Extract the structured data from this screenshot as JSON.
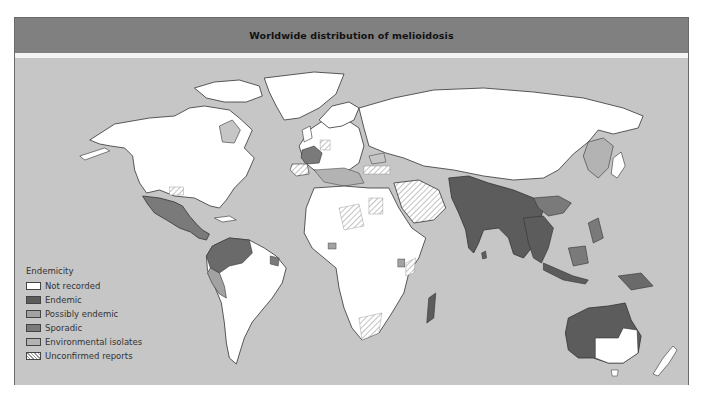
{
  "header": {
    "title": "Worldwide distribution of melioidosis"
  },
  "colors": {
    "ocean": "#c6c6c6",
    "header": "#808080",
    "not_recorded": "#ffffff",
    "endemic": "#5c5c5c",
    "possibly_endemic": "#a2a2a2",
    "sporadic": "#7a7a7a",
    "environmental_isolates": "#b3b3b3",
    "unconfirmed_hatch": "#9a9a9a"
  },
  "legend": {
    "title": "Endemicity",
    "items": [
      {
        "label": "Not recorded",
        "swatch": "not_recorded"
      },
      {
        "label": "Endemic",
        "swatch": "endemic"
      },
      {
        "label": "Possibly endemic",
        "swatch": "possibly_endemic"
      },
      {
        "label": "Sporadic",
        "swatch": "sporadic"
      },
      {
        "label": "Environmental isolates",
        "swatch": "environmental_isolates"
      },
      {
        "label": "Unconfirmed reports",
        "swatch": "unconfirmed_hatch"
      }
    ]
  },
  "regions": {
    "endemic": [
      "Northern Australia",
      "Southeast Asia",
      "South Asia",
      "Madagascar",
      "Northern South America",
      "Papua New Guinea"
    ],
    "sporadic": [
      "Mexico / Central America",
      "France",
      "Brazil (northeast)",
      "China (south)",
      "Indonesia"
    ],
    "possibly_endemic": [
      "Peru / Ecuador",
      "West Africa",
      "Uganda / Kenya"
    ],
    "environmental_isolates": [
      "Mediterranean",
      "Japan / East Asia coast",
      "Scandinavia"
    ],
    "unconfirmed_reports": [
      "Southwest USA",
      "Spain",
      "Germany",
      "Turkey",
      "Egypt",
      "Saudi Arabia",
      "Sahel",
      "Southern Africa",
      "East Africa coast"
    ]
  }
}
